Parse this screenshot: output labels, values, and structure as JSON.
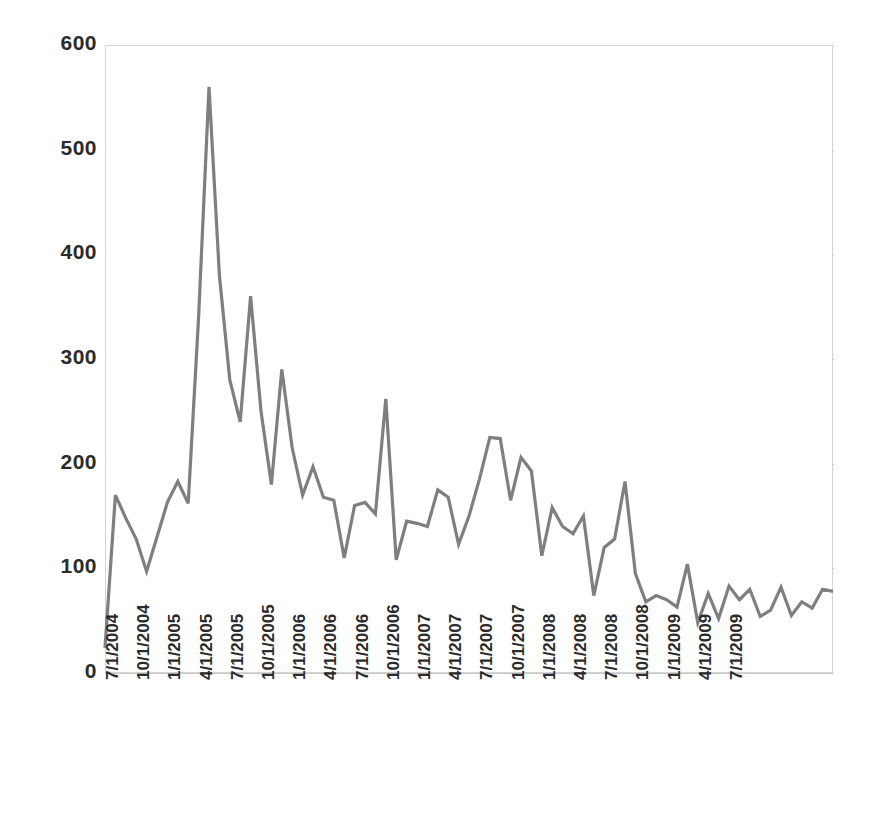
{
  "chart_data": {
    "type": "line",
    "title": "",
    "subtitle": "",
    "xlabel": "",
    "ylabel": "",
    "ylim": [
      0,
      600
    ],
    "ytick_values": [
      0,
      100,
      200,
      300,
      400,
      500,
      600
    ],
    "ytick_labels": [
      "0",
      "100",
      "200",
      "300",
      "400",
      "500",
      "600"
    ],
    "grid": true,
    "legend": null,
    "legend_position": "none",
    "x_tick_labels": [
      "7/1/2004",
      "10/1/2004",
      "1/1/2005",
      "4/1/2005",
      "7/1/2005",
      "10/1/2005",
      "1/1/2006",
      "4/1/2006",
      "7/1/2006",
      "10/1/2006",
      "1/1/2007",
      "4/1/2007",
      "7/1/2007",
      "10/1/2007",
      "1/1/2008",
      "4/1/2008",
      "7/1/2008",
      "10/1/2008",
      "1/1/2009",
      "4/1/2009",
      "7/1/2009"
    ],
    "x_tick_interval_months": 3,
    "x_start": "7/1/2004",
    "x_end": "7/1/2009",
    "point_interval_months": 1,
    "series": [
      {
        "name": "value",
        "color": "#7f7f7f",
        "values": [
          24,
          170,
          148,
          128,
          97,
          130,
          163,
          183,
          162,
          340,
          560,
          380,
          280,
          240,
          360,
          250,
          180,
          290,
          215,
          170,
          197,
          168,
          165,
          110,
          160,
          163,
          152,
          262,
          108,
          145,
          143,
          140,
          175,
          168,
          123,
          150,
          185,
          225,
          224,
          165,
          206,
          193,
          112,
          158,
          140,
          133,
          150,
          74,
          120,
          128,
          183,
          95,
          68,
          74,
          70,
          63,
          104,
          48,
          76,
          52,
          83,
          70,
          80,
          54,
          60,
          82,
          55,
          68,
          62,
          80,
          78
        ]
      }
    ]
  }
}
